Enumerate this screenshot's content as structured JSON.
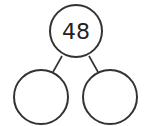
{
  "diagram": {
    "type": "number-bond",
    "whole": {
      "label": "48"
    },
    "parts": [
      {
        "label": ""
      },
      {
        "label": ""
      }
    ],
    "colors": {
      "stroke": "#333333",
      "text": "#222222",
      "background": "#ffffff"
    }
  }
}
